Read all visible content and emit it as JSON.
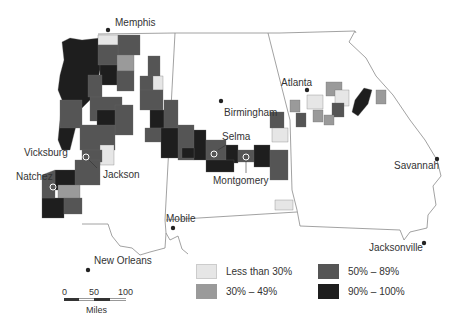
{
  "map": {
    "subject": "Southern US counties (Mississippi, Alabama, Georgia) shaded by percentage category",
    "colors": {
      "less_than_30": "#e6e6e6",
      "30_49": "#9a9a9a",
      "50_89": "#555555",
      "90_100": "#1e1e1e",
      "border": "#888888",
      "city_dot": "#222222"
    },
    "cities": [
      {
        "name": "Memphis",
        "marker": "filled-dot"
      },
      {
        "name": "Birmingham",
        "marker": "filled-dot"
      },
      {
        "name": "Atlanta",
        "marker": "filled-dot"
      },
      {
        "name": "Vicksburg",
        "marker": "open-circle"
      },
      {
        "name": "Jackson",
        "marker": "open-circle"
      },
      {
        "name": "Natchez",
        "marker": "open-circle"
      },
      {
        "name": "Selma",
        "marker": "open-circle"
      },
      {
        "name": "Montgomery",
        "marker": "open-circle"
      },
      {
        "name": "Savannah",
        "marker": "filled-dot"
      },
      {
        "name": "Mobile",
        "marker": "filled-dot"
      },
      {
        "name": "Jacksonville",
        "marker": "filled-dot"
      },
      {
        "name": "New Orleans",
        "marker": "filled-dot"
      }
    ]
  },
  "legend": {
    "items": [
      {
        "label": "Less than 30%",
        "color": "#e6e6e6"
      },
      {
        "label": "30% – 49%",
        "color": "#9a9a9a"
      },
      {
        "label": "50% – 89%",
        "color": "#555555"
      },
      {
        "label": "90% – 100%",
        "color": "#1e1e1e"
      }
    ]
  },
  "scale": {
    "ticks": [
      "0",
      "50",
      "100"
    ],
    "unit": "Miles"
  }
}
